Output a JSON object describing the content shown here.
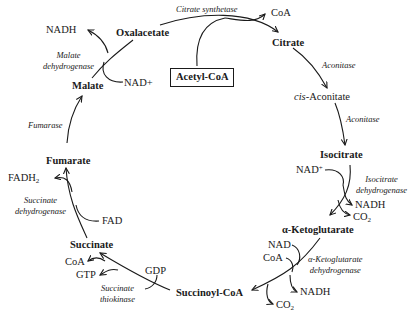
{
  "diagram": {
    "entry": {
      "label": "Acetyl-CoA"
    },
    "metabolites": {
      "oxalacetate": "Oxalacetate",
      "citrate": "Citrate",
      "cis_aconitate_prefix": "cis",
      "cis_aconitate_suffix": "-Aconitate",
      "isocitrate": "Isocitrate",
      "alpha_ketoglutarate": "α-Ketoglutarate",
      "succinoyl_coa": "Succinoyl-CoA",
      "succinate": "Succinate",
      "fumarate": "Fumarate",
      "malate": "Malate"
    },
    "enzymes": {
      "citrate_synthetase": "Citrate synthetase",
      "aconitase_1": "Aconitase",
      "aconitase_2": "Aconitase",
      "isocitrate_dh_1": "Isocitrate",
      "isocitrate_dh_2": "dehydrogenase",
      "akg_dh_1": "α-Ketoglutarate",
      "akg_dh_2": "dehydrogenase",
      "succ_thiokinase_1": "Succinate",
      "succ_thiokinase_2": "thiokinase",
      "succ_dh_1": "Succinate",
      "succ_dh_2": "dehydrogenase",
      "fumarase": "Fumarase",
      "malate_dh_1": "Malate",
      "malate_dh_2": "dehydrogenase"
    },
    "cofactors": {
      "coa_citrate": "CoA",
      "nad_isocitrate": "NAD",
      "nad_isocitrate_sup": "+",
      "nadh_isocitrate": "NADH",
      "co2_isocitrate": "CO",
      "co2_isocitrate_sub": "2",
      "nad_akg": "NAD",
      "coa_akg": "CoA",
      "nadh_akg": "NADH",
      "co2_akg": "CO",
      "co2_akg_sub": "2",
      "gdp": "GDP",
      "gtp": "GTP",
      "coa_succ": "CoA",
      "fad": "FAD",
      "fadh2": "FADH",
      "fadh2_sub": "2",
      "nad_malate": "NAD+",
      "nadh_malate": "NADH"
    }
  }
}
